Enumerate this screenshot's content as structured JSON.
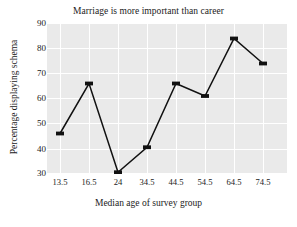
{
  "chart_data": {
    "type": "line",
    "title": "Marriage is more important than career",
    "xlabel": "Median age of survey group",
    "ylabel": "Percentage displaying schema",
    "categories": [
      "13.5",
      "16.5",
      "24",
      "34.5",
      "44.5",
      "54.5",
      "64.5",
      "74.5"
    ],
    "values": [
      46,
      66,
      30.5,
      40.5,
      66,
      61,
      84,
      74
    ],
    "ylim": [
      30,
      90
    ],
    "yticks": [
      "90",
      "80",
      "70",
      "60",
      "50",
      "40",
      "30"
    ],
    "ytick_values": [
      90,
      80,
      70,
      60,
      50,
      40,
      30
    ],
    "grid": true,
    "legend": "none",
    "series_name": "Percentage displaying schema",
    "marker": "square",
    "line_color": "#111111",
    "marker_color": "#111111",
    "plot_background": "#eaeaea",
    "grid_color": "#ffffff",
    "figure_background": "#ffffff"
  }
}
